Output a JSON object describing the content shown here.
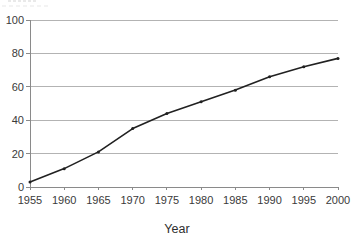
{
  "chart_data": {
    "type": "line",
    "x": [
      1955,
      1960,
      1965,
      1970,
      1975,
      1980,
      1985,
      1990,
      1995,
      2000
    ],
    "values": [
      3,
      11,
      21,
      35,
      44,
      51,
      58,
      66,
      72,
      77
    ],
    "xlabel": "Year",
    "xlim": [
      1955,
      2000
    ],
    "ylim": [
      0,
      100
    ],
    "xticks": [
      1955,
      1960,
      1965,
      1970,
      1975,
      1980,
      1985,
      1990,
      1995,
      2000
    ],
    "yticks": [
      0,
      20,
      40,
      60,
      80,
      100
    ],
    "grid": "horizontal",
    "legend": "none",
    "marker": "dot",
    "colors": {
      "line": "#212121",
      "marker": "#212121",
      "gridline": "#b3b3b3",
      "axis": "#8a8a8a",
      "tick_label": "#3a3a3a",
      "axis_title": "#2e2e2e",
      "background": "#ffffff"
    }
  }
}
